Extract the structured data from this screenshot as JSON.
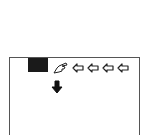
{
  "panel": {
    "border_color": "#555555",
    "block_color": "#1a1a1a",
    "icons": {
      "hand": "pointing-hand-icon",
      "left_arrows": [
        "arrow-left-icon",
        "arrow-left-icon",
        "arrow-left-icon",
        "arrow-left-icon"
      ],
      "down": "arrow-down-icon"
    }
  }
}
